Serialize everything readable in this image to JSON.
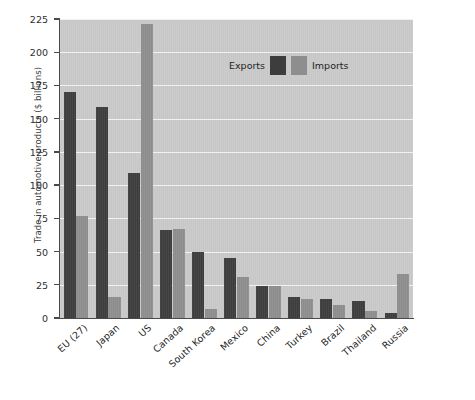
{
  "chart_data": {
    "type": "bar",
    "title": "",
    "xlabel": "",
    "ylabel": "Trade in automotive products ($ billions)",
    "ylim": [
      0,
      225
    ],
    "yticks": [
      0,
      25,
      50,
      75,
      100,
      125,
      150,
      175,
      200,
      225
    ],
    "grid": true,
    "legend_position": "upper right",
    "categories": [
      "EU (27)",
      "Japan",
      "US",
      "Canada",
      "South Korea",
      "Mexico",
      "China",
      "Turkey",
      "Brazil",
      "Thailand",
      "Russia"
    ],
    "series": [
      {
        "name": "Exports",
        "color": "#3d3d3d",
        "values": [
          170,
          159,
          109,
          66,
          50,
          45,
          24,
          16,
          14,
          13,
          4
        ]
      },
      {
        "name": "Imports",
        "color": "#8e8e8e",
        "values": [
          77,
          16,
          221,
          67,
          7,
          31,
          24,
          14,
          10,
          5,
          33
        ]
      }
    ]
  },
  "axis": {
    "y_title": "Trade in automotive products ($ billions)",
    "tick_labels": [
      "0",
      "25",
      "50",
      "75",
      "100",
      "125",
      "150",
      "175",
      "200",
      "225"
    ]
  },
  "legend": {
    "entries": [
      {
        "label": "Exports",
        "swatch": "exports"
      },
      {
        "label": "Imports",
        "swatch": "imports"
      }
    ]
  },
  "colors": {
    "plot_background": "#c9c9c9",
    "gridline": "#f2f2f2",
    "axis": "#4a4a4a",
    "exports": "#3d3d3d",
    "imports": "#8e8e8e"
  }
}
